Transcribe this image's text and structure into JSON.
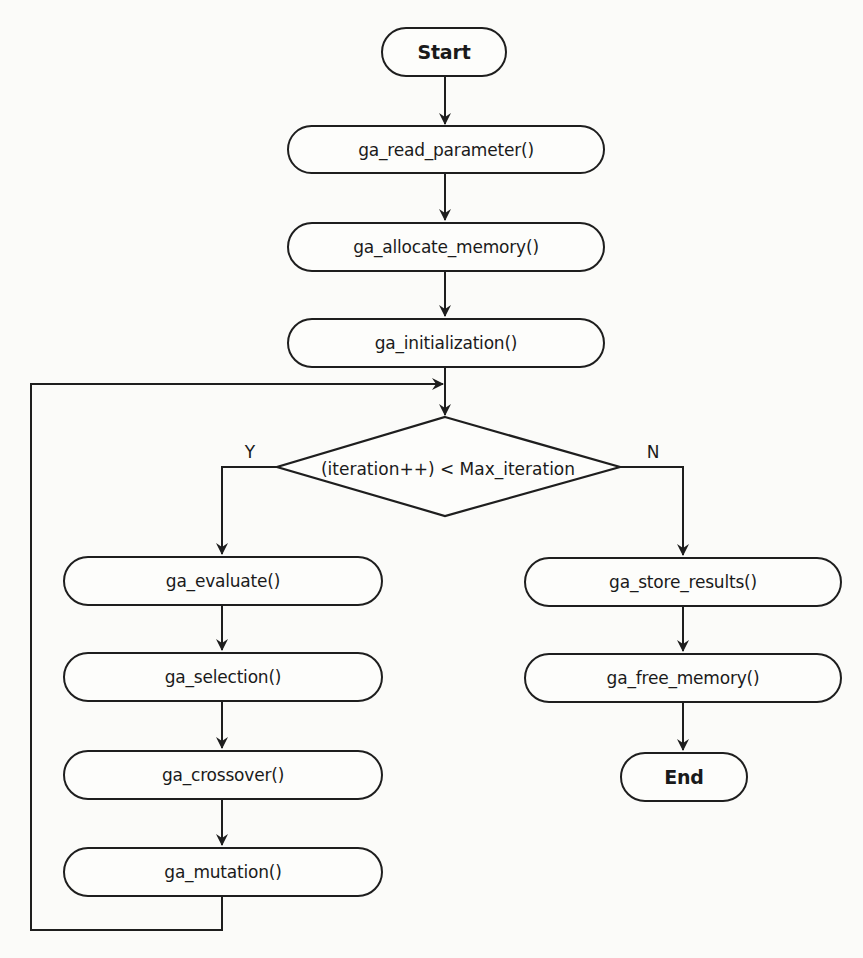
{
  "diagram": {
    "type": "flowchart",
    "colors": {
      "line": "#1e1e1e",
      "background": "#fbfbf9",
      "node_fill": "#fdfdfb",
      "text": "#1a1a1a"
    },
    "nodes": {
      "start": {
        "label": "Start",
        "shape": "terminal"
      },
      "read_parameter": {
        "label": "ga_read_parameter()",
        "shape": "process"
      },
      "allocate_memory": {
        "label": "ga_allocate_memory()",
        "shape": "process"
      },
      "initialization": {
        "label": "ga_initialization()",
        "shape": "process"
      },
      "decision": {
        "label": "(iteration++) < Max_iteration",
        "shape": "decision"
      },
      "evaluate": {
        "label": "ga_evaluate()",
        "shape": "process"
      },
      "selection": {
        "label": "ga_selection()",
        "shape": "process"
      },
      "crossover": {
        "label": "ga_crossover()",
        "shape": "process"
      },
      "mutation": {
        "label": "ga_mutation()",
        "shape": "process"
      },
      "store_results": {
        "label": "ga_store_results()",
        "shape": "process"
      },
      "free_memory": {
        "label": "ga_free_memory()",
        "shape": "process"
      },
      "end": {
        "label": "End",
        "shape": "terminal"
      }
    },
    "branch_labels": {
      "yes": "Y",
      "no": "N"
    },
    "edges": [
      {
        "from": "start",
        "to": "read_parameter"
      },
      {
        "from": "read_parameter",
        "to": "allocate_memory"
      },
      {
        "from": "allocate_memory",
        "to": "initialization"
      },
      {
        "from": "initialization",
        "to": "decision"
      },
      {
        "from": "decision",
        "to": "evaluate",
        "label": "Y"
      },
      {
        "from": "evaluate",
        "to": "selection"
      },
      {
        "from": "selection",
        "to": "crossover"
      },
      {
        "from": "crossover",
        "to": "mutation"
      },
      {
        "from": "mutation",
        "to": "decision",
        "note": "loop back"
      },
      {
        "from": "decision",
        "to": "store_results",
        "label": "N"
      },
      {
        "from": "store_results",
        "to": "free_memory"
      },
      {
        "from": "free_memory",
        "to": "end"
      }
    ]
  }
}
